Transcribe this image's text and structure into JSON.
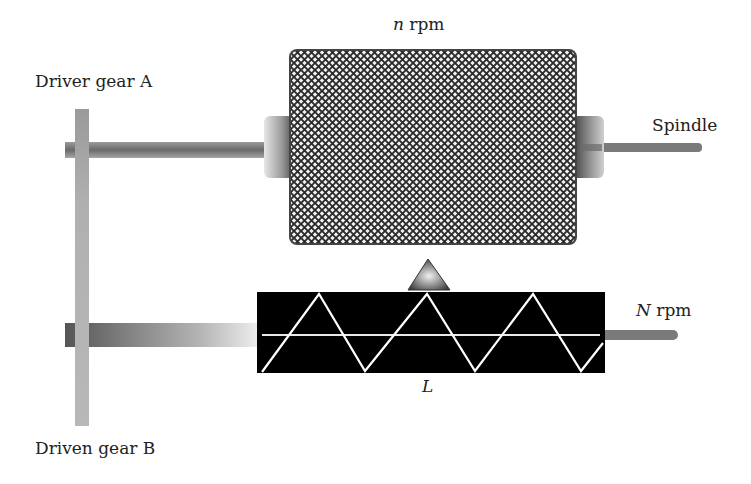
{
  "diagram": {
    "labels": {
      "spindle_speed_var": "n",
      "spindle_speed_unit": "rpm",
      "leadscrew_speed_var": "N",
      "leadscrew_speed_unit": "rpm",
      "driver_gear": "Driver gear A",
      "driven_gear": "Driven gear B",
      "spindle": "Spindle",
      "lead": "L"
    },
    "components": [
      {
        "name": "headstock",
        "fill": "crosshatch"
      },
      {
        "name": "spindle-shaft"
      },
      {
        "name": "driver-gear-A"
      },
      {
        "name": "driven-gear-B"
      },
      {
        "name": "lead-screw",
        "fill": "#000000",
        "thread_color": "#ffffff"
      },
      {
        "name": "tool-pointer",
        "shape": "triangle"
      }
    ],
    "colors": {
      "hatch_dark": "#2b2b2b",
      "hatch_light": "#f2f2f2",
      "gear_bar": "#a9a9a9",
      "shaft": "#7a7a7a",
      "leadscrew": "#000000"
    }
  }
}
